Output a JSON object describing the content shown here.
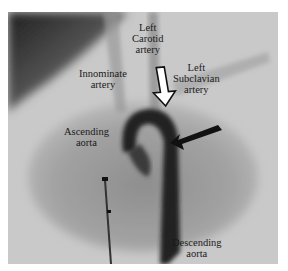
{
  "figure": {
    "labels": {
      "left_carotid": [
        "Left",
        "Carotid",
        "artery"
      ],
      "innominate": [
        "Innominate",
        "artery"
      ],
      "left_subclavian": [
        "Left",
        "Subclavian",
        "artery"
      ],
      "ascending_aorta": [
        "Ascending",
        "aorta"
      ],
      "descending_aorta": [
        "Descending",
        "aorta"
      ]
    },
    "arrows": [
      {
        "style": "hollow",
        "direction": "down",
        "points_to": "aortic arch near left carotid"
      },
      {
        "style": "solid",
        "direction": "left-down",
        "points_to": "aortic isthmus near left subclavian"
      }
    ]
  }
}
